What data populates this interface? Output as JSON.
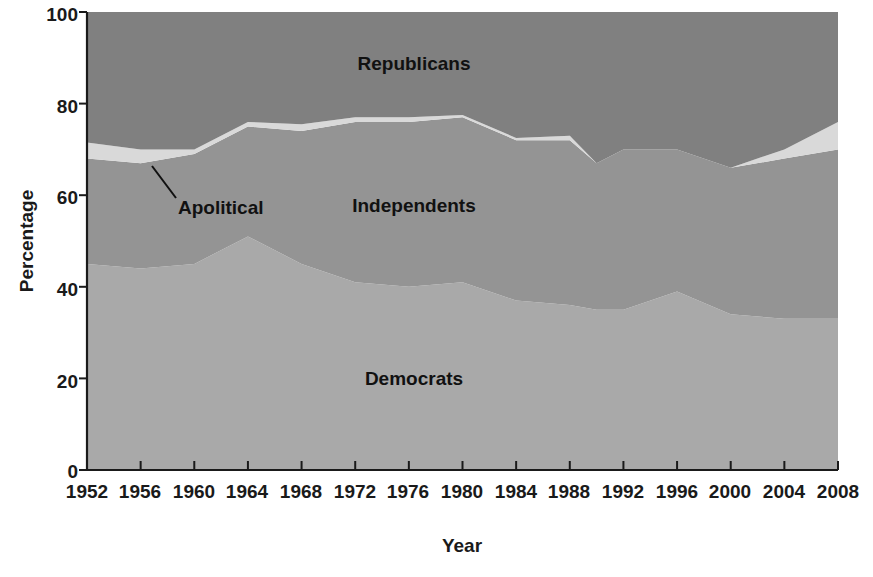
{
  "chart_data": {
    "type": "area",
    "title": "",
    "xlabel": "Year",
    "ylabel": "Percentage",
    "xlim": [
      1952,
      2008
    ],
    "ylim": [
      0,
      100
    ],
    "grid": false,
    "legend_position": "inline-annotations",
    "stacked": true,
    "stack_order_bottom_to_top": [
      "Democrats",
      "Independents",
      "Apolitical",
      "Republicans"
    ],
    "x": [
      1952,
      1956,
      1960,
      1964,
      1968,
      1972,
      1976,
      1980,
      1984,
      1988,
      1990,
      1992,
      1996,
      2000,
      2004,
      2008
    ],
    "xticks": [
      1952,
      1956,
      1960,
      1964,
      1968,
      1972,
      1976,
      1980,
      1984,
      1988,
      1992,
      1996,
      2000,
      2004,
      2008
    ],
    "xtick_labels": [
      "1952",
      "1956",
      "1960",
      "1964",
      "1968",
      "1972",
      "1976",
      "1980",
      "1984",
      "1988",
      "1992",
      "1996",
      "2000",
      "2004",
      "2008"
    ],
    "yticks": [
      0,
      20,
      40,
      60,
      80,
      100
    ],
    "ytick_labels": [
      "0",
      "20",
      "40",
      "60",
      "80",
      "100"
    ],
    "series": [
      {
        "name": "Democrats",
        "color": "#a9a9a9",
        "values": [
          45,
          44,
          45,
          51,
          45,
          41,
          40,
          41,
          37,
          36,
          35,
          35,
          39,
          34,
          33,
          33
        ]
      },
      {
        "name": "Independents",
        "color": "#949494",
        "values": [
          23,
          23,
          24,
          24,
          29,
          35,
          36,
          36,
          35,
          36,
          32,
          35,
          31,
          32,
          35,
          37
        ]
      },
      {
        "name": "Apolitical",
        "color": "#d9d9d9",
        "values": [
          3.5,
          3,
          1,
          1,
          1.5,
          1,
          1,
          0.5,
          0.5,
          1,
          0,
          0,
          0,
          0,
          2,
          6
        ]
      },
      {
        "name": "Republicans",
        "color": "#808080",
        "values": [
          28.5,
          30,
          30,
          24,
          24.5,
          23,
          23,
          22.5,
          27.5,
          27,
          33,
          30,
          30,
          34,
          30,
          24
        ]
      }
    ],
    "cumulative_upper_boundaries": {
      "democrats_top": [
        45,
        44,
        45,
        51,
        45,
        41,
        40,
        41,
        37,
        36,
        35,
        35,
        39,
        34,
        33,
        33
      ],
      "independents_top": [
        68,
        67,
        69,
        75,
        74,
        76,
        76,
        77,
        72,
        72,
        67,
        70,
        70,
        66,
        68,
        70
      ],
      "apolitical_top": [
        71.5,
        70,
        70,
        76,
        75.5,
        77,
        77,
        77.5,
        72.5,
        73,
        67,
        70,
        70,
        66,
        70,
        76
      ],
      "republicans_top": [
        100,
        100,
        100,
        100,
        100,
        100,
        100,
        100,
        100,
        100,
        100,
        100,
        100,
        100,
        100,
        100
      ]
    },
    "annotations": [
      {
        "name": "apolitical-callout",
        "text": "Apolitical",
        "points_to_year": 1958,
        "points_to_value": 69.5
      }
    ],
    "inline_labels": [
      {
        "name": "republicans",
        "text": "Republicans"
      },
      {
        "name": "independents",
        "text": "Independents"
      },
      {
        "name": "democrats",
        "text": "Democrats"
      }
    ]
  },
  "colors": {
    "democrats": "#a9a9a9",
    "independents": "#949494",
    "apolitical": "#d9d9d9",
    "republicans": "#808080",
    "axis": "#1a1a1a",
    "text": "#111111",
    "background": "#ffffff"
  },
  "axes": {
    "y_title": "Percentage",
    "x_title": "Year"
  },
  "labels": {
    "republicans": "Republicans",
    "independents": "Independents",
    "democrats": "Democrats",
    "apolitical": "Apolitical"
  },
  "yticks": {
    "t0": "0",
    "t20": "20",
    "t40": "40",
    "t60": "60",
    "t80": "80",
    "t100": "100"
  },
  "xticks": {
    "x1952": "1952",
    "x1956": "1956",
    "x1960": "1960",
    "x1964": "1964",
    "x1968": "1968",
    "x1972": "1972",
    "x1976": "1976",
    "x1980": "1980",
    "x1984": "1984",
    "x1988": "1988",
    "x1992": "1992",
    "x1996": "1996",
    "x2000": "2000",
    "x2004": "2004",
    "x2008": "2008"
  }
}
